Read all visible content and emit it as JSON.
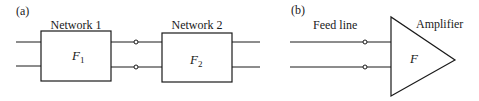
{
  "panel_a": {
    "label": "(a)",
    "network1": {
      "title": "Network 1",
      "symbol": "F",
      "subscript": "1"
    },
    "network2": {
      "title": "Network 2",
      "symbol": "F",
      "subscript": "2"
    }
  },
  "panel_b": {
    "label": "(b)",
    "feed_line": {
      "title": "Feed line"
    },
    "amplifier": {
      "title": "Amplifier",
      "symbol": "F"
    }
  },
  "colors": {
    "stroke": "#1a1a1a",
    "background": "#ffffff"
  }
}
